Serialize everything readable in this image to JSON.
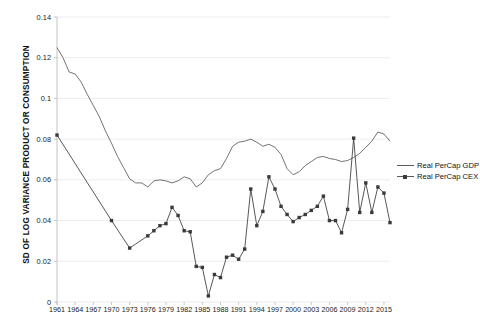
{
  "chart_data": {
    "type": "line",
    "title": "",
    "xlabel": "",
    "ylabel": "SD OF LOG VARIANCE PRODUCT OR CONSUMPTION",
    "ylim": [
      0,
      0.14
    ],
    "ytick_values": [
      0,
      0.02,
      0.04,
      0.06,
      0.08,
      0.1,
      0.12,
      0.14
    ],
    "ytick_labels": [
      "0",
      "0.02",
      "0.04",
      "0.06",
      "0.08",
      "0.1",
      "0.12",
      "0.14"
    ],
    "xlim": [
      1961,
      2016
    ],
    "xtick_labels": [
      "1961",
      "1964",
      "1967",
      "1970",
      "1973",
      "1976",
      "1979",
      "1982",
      "1985",
      "1988",
      "1991",
      "1994",
      "1997",
      "2000",
      "2003",
      "2006",
      "2009",
      "2012",
      "2015"
    ],
    "grid": "horizontal",
    "legend_position": "right",
    "x": [
      1961,
      1962,
      1963,
      1964,
      1965,
      1966,
      1967,
      1968,
      1969,
      1970,
      1971,
      1972,
      1973,
      1974,
      1975,
      1976,
      1977,
      1978,
      1979,
      1980,
      1981,
      1982,
      1983,
      1984,
      1985,
      1986,
      1987,
      1988,
      1989,
      1990,
      1991,
      1992,
      1993,
      1994,
      1995,
      1996,
      1997,
      1998,
      1999,
      2000,
      2001,
      2002,
      2003,
      2004,
      2005,
      2006,
      2007,
      2008,
      2009,
      2010,
      2011,
      2012,
      2013,
      2014,
      2015,
      2016
    ],
    "series": [
      {
        "name": "Real PerCap GDP",
        "marker": "none",
        "color": "#5a5a5a",
        "values": [
          0.125,
          0.12,
          0.113,
          0.112,
          0.108,
          0.102,
          0.0965,
          0.091,
          0.084,
          0.078,
          0.0715,
          0.066,
          0.0605,
          0.0585,
          0.0585,
          0.0565,
          0.0595,
          0.06,
          0.0595,
          0.0585,
          0.0595,
          0.0615,
          0.0605,
          0.0565,
          0.0585,
          0.0625,
          0.0645,
          0.0655,
          0.0705,
          0.0765,
          0.0785,
          0.079,
          0.08,
          0.0785,
          0.0765,
          0.0775,
          0.076,
          0.0725,
          0.0655,
          0.0625,
          0.064,
          0.067,
          0.069,
          0.071,
          0.0715,
          0.0705,
          0.07,
          0.069,
          0.0695,
          0.071,
          0.073,
          0.076,
          0.079,
          0.0835,
          0.0825,
          0.079
        ]
      },
      {
        "name": "Real PerCap CEX",
        "marker": "square",
        "color": "#3a3a3a",
        "values": [
          0.082,
          null,
          null,
          null,
          null,
          null,
          null,
          null,
          null,
          0.04,
          null,
          null,
          0.0265,
          null,
          null,
          0.0325,
          0.035,
          0.0375,
          0.0385,
          0.0465,
          0.0425,
          0.035,
          0.0345,
          0.0175,
          0.017,
          0.003,
          0.0135,
          0.012,
          0.022,
          0.023,
          0.021,
          0.026,
          0.0555,
          0.0375,
          0.0445,
          0.0615,
          0.0555,
          0.047,
          0.043,
          0.0395,
          0.0415,
          0.043,
          0.045,
          0.047,
          0.052,
          0.04,
          0.04,
          0.034,
          0.0455,
          0.0805,
          0.044,
          0.0585,
          0.044,
          0.0565,
          0.0535,
          0.039
        ]
      }
    ],
    "legend": [
      {
        "label": "Real PerCap GDP",
        "marker": "none"
      },
      {
        "label": "Real PerCap CEX",
        "marker": "square"
      }
    ],
    "colors": {
      "gdp_line": "#5a5a5a",
      "cex_line": "#3a3a3a",
      "grid": "#e8e8e8",
      "axis": "#bdbdbd",
      "text": "#1a1a1a",
      "background": "#ffffff"
    }
  }
}
